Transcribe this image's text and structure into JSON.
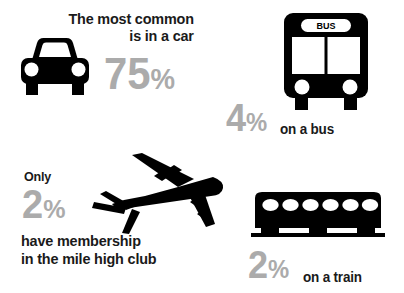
{
  "meta": {
    "background_color": "#ffffff",
    "text_color": "#1a1a1a",
    "percent_color": "#ababab",
    "icon_color": "#000000"
  },
  "car": {
    "heading_line1": "The most common",
    "heading_line2": "is in a car",
    "percent_value": "75",
    "percent_symbol": "%",
    "icon": "car-front-icon"
  },
  "bus": {
    "sign_text": "BUS",
    "percent_value": "4",
    "percent_symbol": "%",
    "suffix": "on a bus",
    "icon": "bus-front-icon"
  },
  "plane": {
    "prefix": "Only",
    "percent_value": "2",
    "percent_symbol": "%",
    "line1": "have membership",
    "line2": "in the mile high club",
    "icon": "airplane-icon"
  },
  "train": {
    "percent_value": "2",
    "percent_symbol": "%",
    "suffix": "on a train",
    "icon": "train-carriage-icon",
    "window_count": 6
  }
}
